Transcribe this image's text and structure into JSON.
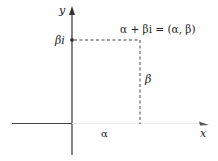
{
  "diagram": {
    "type": "complex-plane",
    "axes": {
      "y_label": "y",
      "x_label": "x"
    },
    "point": {
      "equation": "α + βi = (α, β)",
      "imag_tick_label": "βi",
      "vertical_segment_label": "β",
      "horizontal_segment_label": "α"
    },
    "colors": {
      "axis": "#333333",
      "dashes": "#444444",
      "text": "#222222"
    }
  }
}
